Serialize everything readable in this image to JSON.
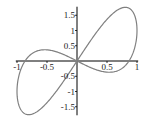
{
  "chart_data": {
    "type": "line",
    "title": "",
    "xlabel": "",
    "ylabel": "",
    "xlim": [
      -1,
      1
    ],
    "ylim": [
      -1.76,
      1.76
    ],
    "grid": false,
    "legend": null,
    "x_ticks": [
      -1,
      -0.5,
      0.5,
      1
    ],
    "x_tick_labels": [
      "-1",
      "-0.5",
      "0.5",
      "1"
    ],
    "y_ticks": [
      1.5,
      1,
      0.5,
      -0.5,
      -1,
      -1.5
    ],
    "y_tick_labels": [
      "1.5",
      "1",
      "0.5",
      "-0.5",
      "-1",
      "-1.5"
    ],
    "series": [
      {
        "name": "curve",
        "color": "#808080",
        "x": [
          0,
          0.31,
          0.59,
          0.81,
          0.95,
          1.0,
          0.95,
          0.81,
          0.59,
          0.31,
          0,
          -0.31,
          -0.59,
          -0.81,
          -0.95,
          -1.0,
          -0.95,
          -0.81,
          -0.59,
          -0.31,
          0
        ],
        "y": [
          0,
          0.9,
          1.54,
          1.76,
          1.54,
          1.0,
          0.36,
          -0.14,
          -0.36,
          -0.28,
          0,
          0.28,
          0.36,
          0.14,
          -0.36,
          -1.0,
          -1.54,
          -1.76,
          -1.54,
          -0.9,
          0
        ]
      }
    ]
  }
}
